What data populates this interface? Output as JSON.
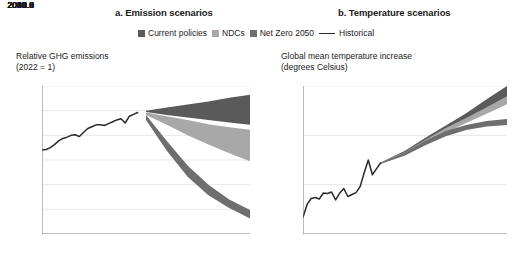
{
  "figure": {
    "legend": {
      "items": [
        {
          "label": "Current policies",
          "type": "area",
          "color": "#5a5a5a",
          "name": "current-policies"
        },
        {
          "label": "NDCs",
          "type": "area",
          "color": "#a8a8a8",
          "name": "ndcs"
        },
        {
          "label": "Net Zero 2050",
          "type": "area",
          "color": "#6e6e6e",
          "name": "net-zero-2050"
        },
        {
          "label": "Historical",
          "type": "line",
          "color": "#2b2b2b",
          "name": "historical"
        }
      ]
    }
  },
  "chart_data": [
    {
      "type": "area",
      "panel": "a",
      "title": "a. Emission scenarios",
      "ylabel": "Relative GHG emissions\n(2022 = 1)",
      "ylabel_line1": "Relative GHG emissions",
      "ylabel_line2": "(2022 = 1)",
      "xlabel": "",
      "xlim": [
        2000,
        2050
      ],
      "ylim": [
        0,
        1.2
      ],
      "grid": true,
      "legend_position": "top-center",
      "yticks": [
        "0",
        "0.2",
        "0.4",
        "0.6",
        "0.8",
        "1.0",
        "1.2"
      ],
      "ytick_values": [
        0,
        0.2,
        0.4,
        0.6,
        0.8,
        1.0,
        1.2
      ],
      "xticks": [
        "2000",
        "2010",
        "2020",
        "2030",
        "2040",
        "2050"
      ],
      "xtick_values": [
        2000,
        2010,
        2020,
        2030,
        2040,
        2050
      ],
      "series": [
        {
          "name": "Historical",
          "type": "line",
          "color": "#2b2b2b",
          "x": [
            2000,
            2001,
            2002,
            2003,
            2004,
            2005,
            2006,
            2007,
            2008,
            2009,
            2010,
            2011,
            2012,
            2013,
            2014,
            2015,
            2016,
            2017,
            2018,
            2019,
            2020,
            2021,
            2022,
            2023
          ],
          "values": [
            0.68,
            0.685,
            0.7,
            0.725,
            0.755,
            0.775,
            0.785,
            0.8,
            0.805,
            0.79,
            0.825,
            0.855,
            0.87,
            0.885,
            0.885,
            0.88,
            0.895,
            0.91,
            0.925,
            0.935,
            0.9,
            0.955,
            0.97,
            0.985
          ]
        },
        {
          "name": "Current policies",
          "type": "band",
          "color": "#5a5a5a",
          "x": [
            2025,
            2030,
            2035,
            2040,
            2045,
            2050
          ],
          "upper": [
            1.0,
            1.025,
            1.05,
            1.075,
            1.105,
            1.13
          ],
          "lower": [
            0.99,
            0.965,
            0.945,
            0.925,
            0.905,
            0.885
          ]
        },
        {
          "name": "NDCs",
          "type": "band",
          "color": "#a8a8a8",
          "x": [
            2025,
            2030,
            2035,
            2040,
            2045,
            2050
          ],
          "upper": [
            0.985,
            0.955,
            0.925,
            0.89,
            0.865,
            0.845
          ],
          "lower": [
            0.965,
            0.885,
            0.8,
            0.725,
            0.655,
            0.59
          ]
        },
        {
          "name": "Net Zero 2050",
          "type": "band",
          "color": "#6e6e6e",
          "x": [
            2025,
            2030,
            2035,
            2040,
            2045,
            2050
          ],
          "upper": [
            0.965,
            0.755,
            0.555,
            0.4,
            0.28,
            0.195
          ],
          "lower": [
            0.925,
            0.675,
            0.465,
            0.315,
            0.21,
            0.125
          ]
        }
      ]
    },
    {
      "type": "area",
      "panel": "b",
      "title": "b. Temperature scenarios",
      "ylabel": "Global mean temperature increase\n(degrees Celsius)",
      "ylabel_line1": "Global mean temperature increase",
      "ylabel_line2": "(degrees Celsius)",
      "xlabel": "",
      "xlim": [
        2000,
        2050
      ],
      "ylim": [
        0.5,
        2.0
      ],
      "grid": true,
      "legend_position": "top-center",
      "yticks": [
        "0.5",
        "1.0",
        "1.5",
        "2.0"
      ],
      "ytick_values": [
        0.5,
        1.0,
        1.5,
        2.0
      ],
      "xticks": [
        "2000",
        "2010",
        "2020",
        "2030",
        "2040",
        "2050"
      ],
      "xtick_values": [
        2000,
        2010,
        2020,
        2030,
        2040,
        2050
      ],
      "series": [
        {
          "name": "Historical",
          "type": "line",
          "color": "#2b2b2b",
          "x": [
            2000,
            2001,
            2002,
            2003,
            2004,
            2005,
            2006,
            2007,
            2008,
            2009,
            2010,
            2011,
            2012,
            2013,
            2014,
            2015,
            2016,
            2017,
            2018,
            2019
          ],
          "values": [
            0.67,
            0.8,
            0.86,
            0.87,
            0.855,
            0.915,
            0.91,
            0.925,
            0.845,
            0.915,
            0.96,
            0.88,
            0.9,
            0.92,
            0.98,
            1.12,
            1.25,
            1.1,
            1.16,
            1.22
          ]
        },
        {
          "name": "Current policies",
          "type": "band",
          "color": "#5a5a5a",
          "x": [
            2019,
            2025,
            2030,
            2035,
            2040,
            2045,
            2050
          ],
          "upper": [
            1.225,
            1.345,
            1.475,
            1.6,
            1.725,
            1.865,
            2.0
          ],
          "lower": [
            1.215,
            1.315,
            1.435,
            1.555,
            1.665,
            1.775,
            1.875
          ]
        },
        {
          "name": "NDCs",
          "type": "band",
          "color": "#a8a8a8",
          "x": [
            2019,
            2025,
            2030,
            2035,
            2040,
            2045,
            2050
          ],
          "upper": [
            1.222,
            1.332,
            1.455,
            1.575,
            1.675,
            1.785,
            1.895
          ],
          "lower": [
            1.212,
            1.305,
            1.415,
            1.525,
            1.625,
            1.72,
            1.815
          ]
        },
        {
          "name": "Net Zero 2050",
          "type": "band",
          "color": "#6e6e6e",
          "x": [
            2019,
            2025,
            2030,
            2035,
            2040,
            2045,
            2050
          ],
          "upper": [
            1.22,
            1.325,
            1.445,
            1.545,
            1.605,
            1.645,
            1.665
          ],
          "lower": [
            1.21,
            1.295,
            1.4,
            1.49,
            1.555,
            1.59,
            1.605
          ]
        }
      ]
    }
  ]
}
